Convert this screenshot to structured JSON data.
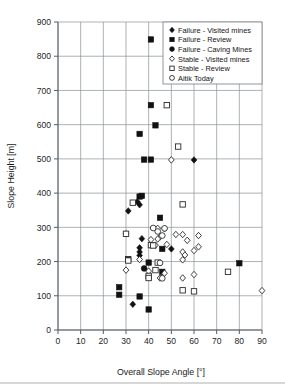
{
  "chart_data": {
    "type": "scatter",
    "title": "",
    "xlabel": "Overall Slope Angle [°]",
    "ylabel": "Slope Height [m]",
    "xlim": [
      0,
      90
    ],
    "ylim": [
      0,
      900
    ],
    "xticks": [
      0,
      10,
      20,
      30,
      40,
      50,
      60,
      70,
      80,
      90
    ],
    "yticks": [
      0,
      100,
      200,
      300,
      400,
      500,
      600,
      700,
      800,
      900
    ],
    "grid": true,
    "legend_position": "top-right",
    "series": [
      {
        "name": "Failure - Visited mines",
        "marker": "filled-diamond",
        "color": "#111111",
        "points": [
          [
            60,
            497
          ],
          [
            35,
            375
          ],
          [
            36,
            366
          ],
          [
            31,
            348
          ],
          [
            37,
            267
          ],
          [
            50,
            237
          ],
          [
            36,
            240
          ],
          [
            36,
            228
          ],
          [
            36,
            218
          ],
          [
            33,
            75
          ]
        ]
      },
      {
        "name": "Failure - Review",
        "marker": "filled-square",
        "color": "#111111",
        "points": [
          [
            41,
            849
          ],
          [
            41,
            657
          ],
          [
            43,
            598
          ],
          [
            36,
            573
          ],
          [
            38,
            498
          ],
          [
            41,
            498
          ],
          [
            36,
            390
          ],
          [
            45,
            328
          ],
          [
            46,
            237
          ],
          [
            31,
            207
          ],
          [
            40,
            197
          ],
          [
            46,
            170
          ],
          [
            80,
            195
          ],
          [
            27,
            125
          ],
          [
            27,
            103
          ],
          [
            36,
            98
          ],
          [
            40,
            60
          ],
          [
            37,
            392
          ]
        ]
      },
      {
        "name": "Failure - Caving Mines",
        "marker": "filled-circle",
        "color": "#111111",
        "points": [
          [
            38,
            180
          ]
        ]
      },
      {
        "name": "Stable - Visited mines",
        "marker": "open-diamond",
        "color": "#ffffff",
        "points": [
          [
            50,
            497
          ],
          [
            44,
            297
          ],
          [
            47,
            296
          ],
          [
            55,
            279
          ],
          [
            62,
            276
          ],
          [
            52,
            279
          ],
          [
            30,
            281
          ],
          [
            57,
            262
          ],
          [
            45,
            272
          ],
          [
            44,
            266
          ],
          [
            62,
            243
          ],
          [
            60,
            232
          ],
          [
            55,
            228
          ],
          [
            56,
            219
          ],
          [
            48,
            250
          ],
          [
            43,
            248
          ],
          [
            55,
            205
          ],
          [
            30,
            175
          ],
          [
            55,
            152
          ],
          [
            60,
            162
          ],
          [
            90,
            115
          ],
          [
            45,
            152
          ],
          [
            47,
            166
          ],
          [
            36,
            206
          ],
          [
            40,
            172
          ],
          [
            41,
            264
          ]
        ]
      },
      {
        "name": "Stable - Review",
        "marker": "open-square",
        "color": "#ffffff",
        "points": [
          [
            52,
            750
          ],
          [
            48,
            657
          ],
          [
            53,
            536
          ],
          [
            55,
            367
          ],
          [
            33,
            372
          ],
          [
            30,
            281
          ],
          [
            31,
            203
          ],
          [
            41,
            248
          ],
          [
            42,
            247
          ],
          [
            44,
            197
          ],
          [
            43,
            175
          ],
          [
            40,
            158
          ],
          [
            40,
            152
          ],
          [
            75,
            170
          ],
          [
            55,
            116
          ],
          [
            60,
            113
          ]
        ]
      },
      {
        "name": "Aitik Today",
        "marker": "open-circle",
        "color": "#ffffff",
        "points": [
          [
            47,
            297
          ],
          [
            42,
            298
          ],
          [
            44,
            288
          ],
          [
            46,
            276
          ],
          [
            45,
            196
          ],
          [
            46,
            151
          ]
        ]
      }
    ]
  },
  "legend": {
    "items": [
      {
        "label": "Failure - Visited mines",
        "marker": "filled-diamond"
      },
      {
        "label": "Failure - Review",
        "marker": "filled-square"
      },
      {
        "label": "Failure - Caving Mines",
        "marker": "filled-circle"
      },
      {
        "label": "Stable - Visited mines",
        "marker": "open-diamond"
      },
      {
        "label": "Stable - Review",
        "marker": "open-square"
      },
      {
        "label": "Aitik Today",
        "marker": "open-circle"
      }
    ]
  }
}
